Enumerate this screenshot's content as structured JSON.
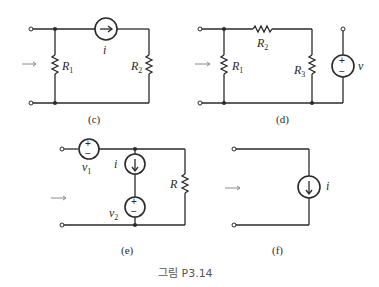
{
  "figure_caption": "그림 P3.14",
  "circuits": [
    {
      "id": "c",
      "label": "(c)",
      "elements": {
        "resistor_1": "R",
        "resistor_1_sub": "1",
        "resistor_2": "R",
        "resistor_2_sub": "2",
        "current_source": "i"
      }
    },
    {
      "id": "d",
      "label": "(d)",
      "elements": {
        "resistor_1": "R",
        "resistor_1_sub": "1",
        "resistor_2": "R",
        "resistor_2_sub": "2",
        "resistor_3": "R",
        "resistor_3_sub": "3",
        "voltage_source": "v",
        "plus": "+",
        "minus": "−"
      }
    },
    {
      "id": "e",
      "label": "(e)",
      "elements": {
        "voltage_source_1": "v",
        "voltage_source_1_sub": "1",
        "voltage_source_2": "v",
        "voltage_source_2_sub": "2",
        "current_source": "i",
        "resistor": "R",
        "plus": "+",
        "minus": "−"
      }
    },
    {
      "id": "f",
      "label": "(f)",
      "elements": {
        "current_source": "i"
      }
    }
  ],
  "colors": {
    "wire": "#2a2a2a",
    "arrow": "#8a8a8a",
    "caption": "#555555"
  }
}
